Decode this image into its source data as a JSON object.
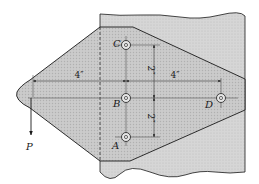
{
  "figure": {
    "type": "engineering-statics-diagram"
  },
  "colors": {
    "background": "#ffffff",
    "member_fill": "#d9d9d9",
    "plate_fill": "#cfcfcf",
    "line": "#1a1a1a",
    "dim_line": "#3a3a3a"
  },
  "bolts": [
    {
      "id": "A",
      "label": "A"
    },
    {
      "id": "B",
      "label": "B"
    },
    {
      "id": "C",
      "label": "C"
    },
    {
      "id": "D",
      "label": "D"
    }
  ],
  "load": {
    "label": "P"
  },
  "dimensions": {
    "horizontal_left": "4″",
    "horizontal_right": "4″",
    "vertical_upper": "2″",
    "vertical_lower": "2″"
  }
}
